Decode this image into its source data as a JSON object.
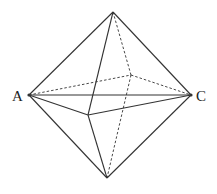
{
  "diagram": {
    "type": "octahedron",
    "labels": {
      "A": "A",
      "C": "C"
    },
    "vertices": {
      "top": [
        113,
        12
      ],
      "A": [
        29,
        95
      ],
      "C": [
        191,
        95
      ],
      "front": [
        88,
        115
      ],
      "back": [
        131,
        75
      ],
      "bottom": [
        107,
        178
      ]
    },
    "solid_edges": [
      [
        "top",
        "A"
      ],
      [
        "top",
        "C"
      ],
      [
        "top",
        "front"
      ],
      [
        "A",
        "C"
      ],
      [
        "A",
        "front"
      ],
      [
        "front",
        "C"
      ],
      [
        "A",
        "bottom"
      ],
      [
        "C",
        "bottom"
      ],
      [
        "front",
        "bottom"
      ]
    ],
    "dashed_edges": [
      [
        "top",
        "back"
      ],
      [
        "A",
        "back"
      ],
      [
        "back",
        "C"
      ],
      [
        "back",
        "bottom"
      ]
    ],
    "stroke_color": "#333333"
  }
}
